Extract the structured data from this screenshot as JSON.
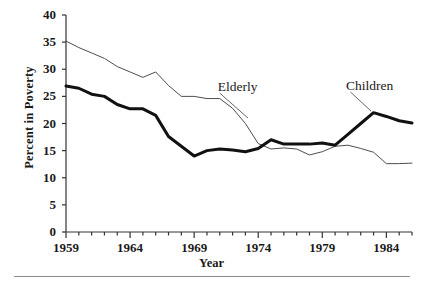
{
  "chart_data": {
    "type": "line",
    "title": "",
    "xlabel": "Year",
    "ylabel": "Percent in Poverty",
    "xlim": [
      1959,
      1986
    ],
    "ylim": [
      0,
      40
    ],
    "yticks": [
      0,
      5,
      10,
      15,
      20,
      25,
      30,
      35,
      40
    ],
    "xticks_labeled": [
      1959,
      1964,
      1969,
      1974,
      1979,
      1984
    ],
    "xticks_all": [
      1959,
      1960,
      1961,
      1962,
      1963,
      1964,
      1965,
      1966,
      1967,
      1968,
      1969,
      1970,
      1971,
      1972,
      1973,
      1974,
      1975,
      1976,
      1977,
      1978,
      1979,
      1980,
      1981,
      1982,
      1983,
      1984,
      1985,
      1986
    ],
    "grid": false,
    "legend_position": "inline-annotation",
    "x": [
      1959,
      1960,
      1961,
      1962,
      1963,
      1964,
      1965,
      1966,
      1967,
      1968,
      1969,
      1970,
      1971,
      1972,
      1973,
      1974,
      1975,
      1976,
      1977,
      1978,
      1979,
      1980,
      1981,
      1982,
      1983,
      1984,
      1985,
      1986
    ],
    "series": [
      {
        "name": "Elderly",
        "style": "thin",
        "color": "#4d4d4d",
        "label_x": 1971.0,
        "label_y": 26.6,
        "values": [
          35.2,
          34.0,
          33.0,
          32.0,
          30.5,
          29.5,
          28.5,
          29.5,
          27.0,
          25.0,
          25.0,
          24.6,
          24.6,
          22.8,
          20.0,
          16.3,
          15.3,
          15.5,
          15.3,
          14.2,
          14.8,
          15.8,
          16.0,
          15.4,
          14.7,
          12.6,
          12.6,
          12.7
        ]
      },
      {
        "name": "Children",
        "style": "thick",
        "color": "#111111",
        "label_x": 1981.0,
        "label_y": 26.8,
        "values": [
          26.9,
          26.5,
          25.4,
          25.0,
          23.5,
          22.7,
          22.7,
          21.5,
          17.6,
          15.8,
          14.0,
          15.0,
          15.3,
          15.1,
          14.8,
          15.4,
          17.0,
          16.2,
          16.2,
          16.2,
          16.4,
          16.0,
          18.0,
          20.0,
          22.0,
          21.3,
          20.5,
          20.1
        ]
      }
    ],
    "annotations": [
      {
        "text": "Elderly",
        "leader_from": [
          1971.0,
          25.6
        ],
        "leader_to": [
          1973.2,
          21.0
        ]
      },
      {
        "text": "Children",
        "leader_from": [
          1981.2,
          25.8
        ],
        "leader_to": [
          1982.8,
          22.3
        ]
      }
    ]
  }
}
